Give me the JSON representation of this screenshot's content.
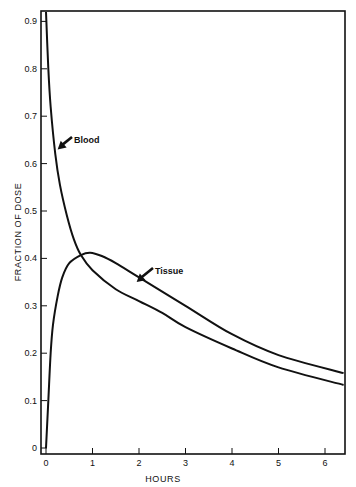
{
  "chart_data": {
    "type": "line",
    "title": "",
    "xlabel": "HOURS",
    "ylabel": "FRACTION OF DOSE",
    "xlim": [
      0,
      6.4
    ],
    "ylim": [
      0,
      0.92
    ],
    "grid": false,
    "legend": "none (inline annotations with arrows)",
    "x_ticks": [
      "0",
      "1",
      "2",
      "3",
      "4",
      "5",
      "6"
    ],
    "y_ticks": [
      "0",
      "0.1",
      "0.2",
      "0.3",
      "0.4",
      "0.5",
      "0.6",
      "0.7",
      "0.8",
      "0.9"
    ],
    "series": [
      {
        "name": "Blood",
        "x": [
          0,
          0.05,
          0.1,
          0.2,
          0.3,
          0.45,
          0.6,
          0.75,
          1.0,
          1.5,
          2.0,
          2.5,
          3.0,
          4.0,
          5.0,
          6.4
        ],
        "values": [
          0.92,
          0.8,
          0.72,
          0.62,
          0.555,
          0.49,
          0.44,
          0.407,
          0.375,
          0.335,
          0.31,
          0.285,
          0.255,
          0.21,
          0.17,
          0.133
        ]
      },
      {
        "name": "Tissue",
        "x": [
          0,
          0.05,
          0.1,
          0.15,
          0.25,
          0.35,
          0.5,
          0.75,
          0.95,
          1.2,
          1.5,
          2.0,
          3.0,
          4.0,
          5.0,
          6.4
        ],
        "values": [
          0,
          0.1,
          0.2,
          0.26,
          0.32,
          0.36,
          0.39,
          0.407,
          0.412,
          0.405,
          0.39,
          0.36,
          0.3,
          0.24,
          0.196,
          0.158
        ]
      }
    ],
    "annotations": [
      {
        "text": "Blood",
        "points_to": {
          "x": 0.25,
          "y": 0.63
        }
      },
      {
        "text": "Tissue",
        "points_to": {
          "x": 1.95,
          "y": 0.35
        }
      }
    ]
  }
}
